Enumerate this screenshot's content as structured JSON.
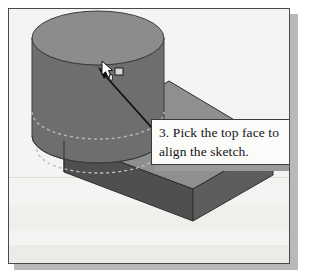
{
  "figure": {
    "background_color": "#ffffff",
    "frame_background": "#f4f4f2",
    "frame_border_color": "#4a4a4a",
    "shadow_color": "#b9b9b9"
  },
  "callout": {
    "line1": "3. Pick the top face to",
    "line2": "align the sketch.",
    "border_color": "#3a3a3a",
    "fill_color": "#fbfbf9",
    "text_color": "#141414",
    "leader_arrow_color": "#101010",
    "leader_from": "160,137",
    "leader_to": "97,68"
  },
  "cursor": {
    "name": "arrow-pointer-with-face-select",
    "fill_color": "#ffffff",
    "outline_color": "#1a1a1a",
    "badge_label": "face-select-square",
    "x": 92,
    "y": 52
  },
  "model": {
    "name": "cylinder-on-base-plate",
    "cylinder": {
      "top_face_color": "#8c8c8c",
      "side_face_color": "#6e6e6e",
      "edge_color": "#3c3c3c",
      "center_x": 97,
      "center_y": 37,
      "radius_x": 66,
      "radius_y": 27,
      "height": 98,
      "hidden_line_style": "dashed",
      "hidden_line_color": "#b5b5b5"
    },
    "base_plate": {
      "top_face_color": "#8f8f8f",
      "front_face_color": "#4f4f4f",
      "right_face_color": "#5e5e5e",
      "edge_color": "#2e2e2e"
    }
  },
  "colors": {
    "light_gray": "#8f8f8f",
    "mid_gray": "#6e6e6e",
    "dark_gray": "#4f4f4f",
    "edge": "#2e2e2e",
    "paper": "#f4f4f2"
  }
}
